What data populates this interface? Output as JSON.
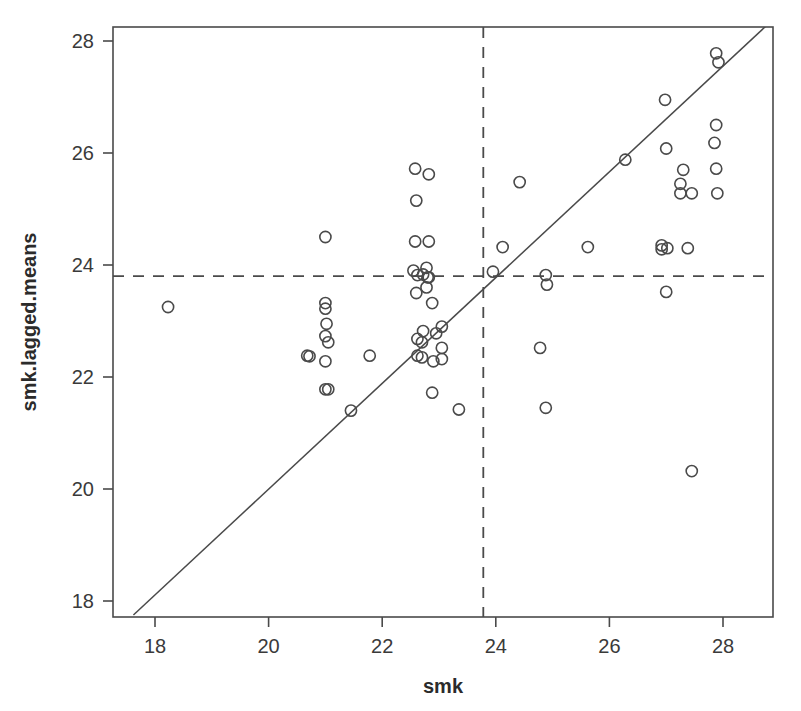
{
  "chart_data": {
    "type": "scatter",
    "title": "",
    "xlabel": "smk",
    "ylabel": "smk.lagged.means",
    "xlim": [
      17.35,
      29.0
    ],
    "ylim": [
      17.72,
      28.45
    ],
    "xticks": [
      18,
      20,
      22,
      24,
      26,
      28
    ],
    "yticks": [
      18,
      20,
      22,
      24,
      26,
      28
    ],
    "xtick_labels": [
      "18",
      "20",
      "22",
      "24",
      "26",
      "28"
    ],
    "ytick_labels": [
      "18",
      "20",
      "22",
      "24",
      "26",
      "28"
    ],
    "grid": false,
    "legend": "none",
    "annotations": {
      "vertical_reference_line": {
        "style": "dashed",
        "x": 23.78,
        "label": "mean of smk"
      },
      "horizontal_reference_line": {
        "style": "dashed",
        "y": 23.8,
        "label": "mean of smk.lagged.means"
      },
      "fit_line": {
        "style": "solid",
        "x_start": 17.62,
        "y_start": 17.75,
        "x_end": 28.95,
        "y_end": 28.45
      }
    },
    "points": [
      [
        18.23,
        23.25
      ],
      [
        20.68,
        22.38
      ],
      [
        20.72,
        22.37
      ],
      [
        21.0,
        24.5
      ],
      [
        21.0,
        23.32
      ],
      [
        21.0,
        23.22
      ],
      [
        21.02,
        22.95
      ],
      [
        21.0,
        22.73
      ],
      [
        21.05,
        22.62
      ],
      [
        21.0,
        22.28
      ],
      [
        21.0,
        21.78
      ],
      [
        21.05,
        21.78
      ],
      [
        21.78,
        22.38
      ],
      [
        21.45,
        21.4
      ],
      [
        22.58,
        25.72
      ],
      [
        22.82,
        25.62
      ],
      [
        22.6,
        25.15
      ],
      [
        22.58,
        24.42
      ],
      [
        22.82,
        24.42
      ],
      [
        22.55,
        23.9
      ],
      [
        22.62,
        23.82
      ],
      [
        22.72,
        23.83
      ],
      [
        22.78,
        23.95
      ],
      [
        22.8,
        23.78
      ],
      [
        22.78,
        23.6
      ],
      [
        22.82,
        23.78
      ],
      [
        22.6,
        23.5
      ],
      [
        22.88,
        23.32
      ],
      [
        22.72,
        22.82
      ],
      [
        22.95,
        22.78
      ],
      [
        22.62,
        22.68
      ],
      [
        22.7,
        22.62
      ],
      [
        22.62,
        22.38
      ],
      [
        22.7,
        22.35
      ],
      [
        23.05,
        22.9
      ],
      [
        22.9,
        22.28
      ],
      [
        23.05,
        22.52
      ],
      [
        23.05,
        22.32
      ],
      [
        22.88,
        21.72
      ],
      [
        23.35,
        21.42
      ],
      [
        23.95,
        23.88
      ],
      [
        24.12,
        24.32
      ],
      [
        24.42,
        25.48
      ],
      [
        24.88,
        23.82
      ],
      [
        24.9,
        23.65
      ],
      [
        24.78,
        22.52
      ],
      [
        24.88,
        21.45
      ],
      [
        25.62,
        24.32
      ],
      [
        26.28,
        25.88
      ],
      [
        26.98,
        26.95
      ],
      [
        26.92,
        24.35
      ],
      [
        27.02,
        24.3
      ],
      [
        26.92,
        24.28
      ],
      [
        27.38,
        24.3
      ],
      [
        27.0,
        26.08
      ],
      [
        27.25,
        25.45
      ],
      [
        27.3,
        25.7
      ],
      [
        27.25,
        25.28
      ],
      [
        27.45,
        25.28
      ],
      [
        27.88,
        26.5
      ],
      [
        27.85,
        26.18
      ],
      [
        27.88,
        25.72
      ],
      [
        27.9,
        25.28
      ],
      [
        27.0,
        23.52
      ],
      [
        27.45,
        20.32
      ],
      [
        27.88,
        27.78
      ],
      [
        27.92,
        27.62
      ]
    ]
  }
}
